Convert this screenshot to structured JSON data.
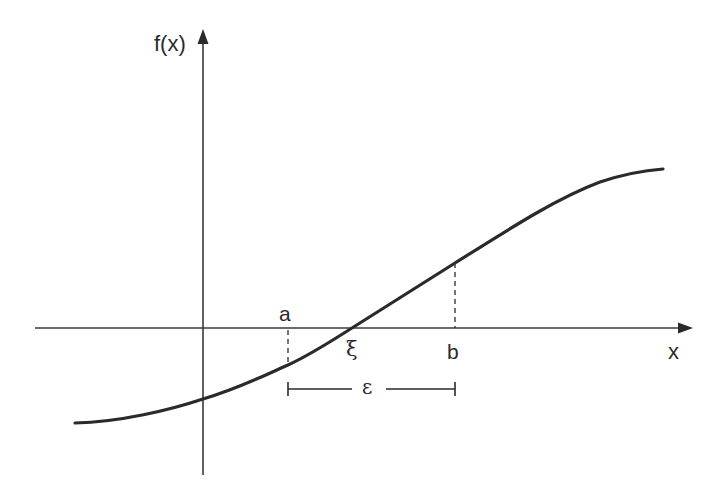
{
  "figure": {
    "colors": {
      "background": "#ffffff",
      "ink": "#2a2a2a"
    }
  },
  "axes": {
    "y_label": "f(x)",
    "x_label": "x"
  },
  "points": {
    "a_label": "a",
    "b_label": "b",
    "root_label": "ξ",
    "interval_label": "ε"
  }
}
